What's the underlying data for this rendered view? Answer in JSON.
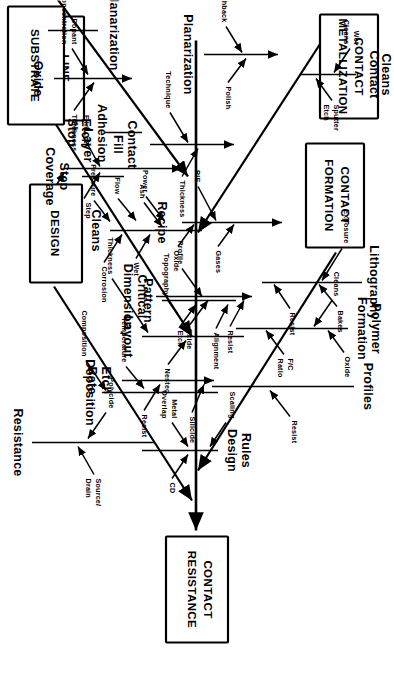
{
  "diagram": {
    "type": "fishbone-ishikawa",
    "orientation": "rotated-90-clockwise",
    "effect": {
      "line1": "CONTACT",
      "line2": "RESISTANCE"
    },
    "ink_color": "#000000",
    "paper_color": "#ffffff"
  },
  "categories": [
    {
      "id": "contact-formation",
      "label_line1": "CONTACT",
      "label_line2": "FORMATION",
      "side": "upper",
      "bones": [
        {
          "name": "Lithography",
          "causes": [
            "Exposure",
            "Bakes",
            "Resist"
          ]
        },
        {
          "name_line1": "Polymer",
          "name_line2": "Formation",
          "name": "Polymer Formation",
          "causes": [
            "Cleans",
            "F/C Ratio",
            "Oxide"
          ]
        },
        {
          "name": "Profiles",
          "causes": [
            "Resist"
          ]
        },
        {
          "name": "Recipe",
          "causes": [
            "RIE",
            "Gases",
            "Oxide",
            "Power",
            "Flow",
            "Pressure"
          ]
        },
        {
          "name_line1": "Critical",
          "name_line2": "Dimension",
          "name": "Critical Dimension",
          "causes": [
            "Oxide",
            "Resist"
          ]
        },
        {
          "name_line1": "Adhesion",
          "name_line2": "Layer",
          "name": "Adhesion Layer",
          "causes": [
            "Film Thickness",
            "Step Coverage",
            "Film Composition"
          ]
        },
        {
          "name_line1": "Etch",
          "name_line2": "Rate",
          "name": "Etch Rate",
          "causes": [
            "Resist",
            "Silicide"
          ]
        }
      ]
    },
    {
      "id": "contact-metallization",
      "label_line1": "CONTACT",
      "label_line2": "METALLIZATION",
      "side": "upper",
      "bones": [
        {
          "name_line1": "Contact",
          "name_line2": "Cleans",
          "name": "Contact Cleans",
          "causes": [
            "Wet Cleans",
            "Sputter Etch"
          ]
        },
        {
          "name": "Planarization",
          "causes": [
            "Etchback",
            "Polish"
          ]
        },
        {
          "name_line1": "Contact",
          "name_line2": "Fill",
          "name": "Contact Fill",
          "causes": [
            "Technique",
            "Thickness"
          ]
        }
      ]
    },
    {
      "id": "design",
      "label_line1": "DESIGN",
      "label_line2": "",
      "side": "lower",
      "bones": [
        {
          "name": "Resistance",
          "causes": [
            "Polycide",
            "Source/ Drain"
          ]
        },
        {
          "name": "Layout",
          "causes": [
            "Nested",
            "Topography",
            "Thickness"
          ]
        },
        {
          "name": "Deposition",
          "causes": [
            "Temperature",
            "Composition"
          ]
        },
        {
          "name_line1": "Design",
          "name_line2": "Rules",
          "name": "Design Rules",
          "causes": [
            "CD",
            "Metal Overlap",
            "Scaling"
          ]
        }
      ]
    },
    {
      "id": "line-metallization",
      "label_line1": "LINE",
      "label_line2": "METALLIZATION",
      "side": "lower",
      "bones": [
        {
          "name_line1": "Step",
          "name_line2": "Coverage",
          "name": "Step Coverage",
          "causes": []
        },
        {
          "name": "Pattern",
          "causes": [
            "Profile",
            "Etch",
            "Alignment"
          ]
        },
        {
          "name": "Cleans",
          "causes": [
            "Ash",
            "Wet",
            "Corrosion"
          ]
        }
      ]
    },
    {
      "id": "substrate",
      "label_line1": "SUBSTRATE",
      "label_line2": "",
      "side": "lower",
      "bones": [
        {
          "name_line1": "Etch",
          "name_line2": "Stop",
          "name": "Etch Stop",
          "causes": []
        },
        {
          "name": "Oxide",
          "causes": [
            "Dopant Concentration",
            "Thickness"
          ]
        },
        {
          "name": "Planarization",
          "causes": []
        }
      ]
    }
  ],
  "labels": {
    "head_l1": "CONTACT",
    "head_l2": "RESISTANCE",
    "cf_l1": "CONTACT",
    "cf_l2": "FORMATION",
    "cm_l1": "CONTACT",
    "cm_l2": "METALLIZATION",
    "design": "DESIGN",
    "lm_l1": "LINE",
    "lm_l2": "METALLIZATION",
    "substrate": "SUBSTRATE",
    "lithography": "Lithography",
    "exposure": "Exposure",
    "bakes": "Bakes",
    "resist1": "Resist",
    "polymer1": "Polymer",
    "polymer2": "Formation",
    "cleans_p": "Cleans",
    "fc_ratio1": "F/C",
    "fc_ratio2": "Ratio",
    "oxide_p": "Oxide",
    "profiles": "Profiles",
    "resist_pf": "Resist",
    "recipe": "Recipe",
    "rie": "RIE",
    "gases": "Gases",
    "oxide_r": "Oxide",
    "power": "Power",
    "flow": "Flow",
    "pressure": "Pressure",
    "critical1": "Critical",
    "critical2": "Dimension",
    "oxide_cd": "Oxide",
    "resist_cd": "Resist",
    "adhesion1": "Adhesion",
    "adhesion2": "Layer",
    "film_thick1": "Film",
    "film_thick2": "Thickness",
    "stepcov1": "Step",
    "stepcov2": "Coverage",
    "filmcomp1": "Film",
    "filmcomp2": "Composition",
    "etchrate1": "Etch",
    "etchrate2": "Rate",
    "resist_er": "Resist",
    "silicide": "Silicide",
    "contactcleans1": "Contact",
    "contactcleans2": "Cleans",
    "wetcleans1": "Wet",
    "wetcleans2": "Cleans",
    "sputter1": "Sputter",
    "sputter2": "Etch",
    "planarization_cm": "Planarization",
    "etchback": "Etchback",
    "polish": "Polish",
    "contactfill1": "Contact",
    "contactfill2": "Fill",
    "technique": "Technique",
    "thickness_cf": "Thickness",
    "resistance": "Resistance",
    "polycide": "Polycide",
    "source1": "Source/",
    "source2": "Drain",
    "layout": "Layout",
    "nested": "Nested",
    "topography": "Topography",
    "thickness_l": "Thickness",
    "deposition": "Deposition",
    "temperature": "Temperature",
    "composition": "Composition",
    "designrules1": "Design",
    "designrules2": "Rules",
    "cd": "CD",
    "metal1": "Metal",
    "metal2": "Overlap",
    "scaling": "Scaling",
    "stepcoverage1": "Step",
    "stepcoverage2": "Coverage",
    "pattern": "Pattern",
    "profile": "Profile",
    "etch_p": "Etch",
    "alignment": "Alignment",
    "cleans_lm": "Cleans",
    "ash": "Ash",
    "wet": "Wet",
    "corrosion": "Corrosion",
    "etchstop1": "Etch",
    "etchstop2": "Stop",
    "oxide_sub": "Oxide",
    "dopant1": "Dopant",
    "dopant2": "Concentration",
    "thickness_ox": "Thickness",
    "planarization_sub": "Planarization"
  }
}
